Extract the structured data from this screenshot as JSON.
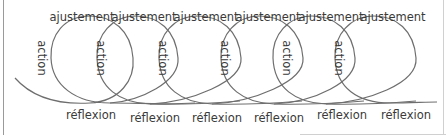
{
  "diagram": {
    "type": "spiral-cycle",
    "colors": {
      "stroke": "#6e6e6e",
      "text": "#3a3a3a",
      "border": "#9a9a9a"
    },
    "top_labels": [
      "ajustement",
      "ajustement",
      "ajustement",
      "ajustement",
      "ajustement",
      "ajustement"
    ],
    "side_labels": [
      "action",
      "action",
      "action",
      "action",
      "action",
      "action"
    ],
    "bottom_labels": [
      "réflexion",
      "réflexion",
      "réflexion",
      "réflexion",
      "réflexion",
      "réflexion"
    ]
  }
}
